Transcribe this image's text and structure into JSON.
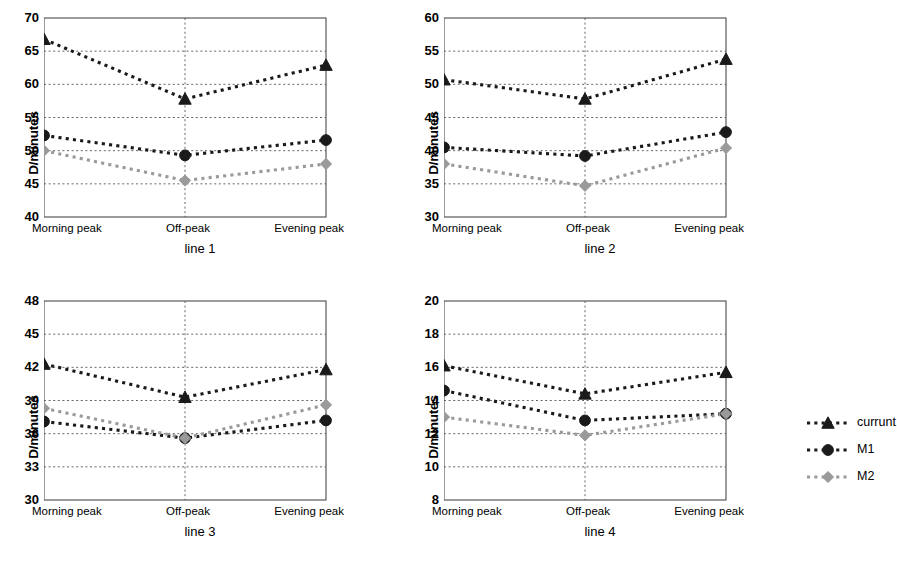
{
  "figure": {
    "background": "#ffffff",
    "series_colors": {
      "currunt": "#1a1a1a",
      "M1": "#1a1a1a",
      "M2": "#9a9a9a"
    },
    "y_axis_label": "D/minutes",
    "categories": [
      "Morning peak",
      "Off-peak",
      "Evening peak"
    ]
  },
  "legend": {
    "position": "right",
    "entries": [
      {
        "label": "currunt",
        "marker": "triangle",
        "color": "#1a1a1a"
      },
      {
        "label": "M1",
        "marker": "circle",
        "color": "#1a1a1a"
      },
      {
        "label": "M2",
        "marker": "diamond",
        "color": "#9a9a9a"
      }
    ]
  },
  "chart_data": [
    {
      "type": "line",
      "title": "line 1",
      "xlabel": "",
      "ylabel": "D/minutes",
      "categories": [
        "Morning peak",
        "Off-peak",
        "Evening peak"
      ],
      "ylim": [
        40,
        70
      ],
      "yticks": [
        40,
        45,
        50,
        55,
        60,
        65,
        70
      ],
      "grid": true,
      "series": [
        {
          "name": "currunt",
          "marker": "triangle",
          "color": "#1a1a1a",
          "values": [
            66.8,
            57.8,
            62.9
          ]
        },
        {
          "name": "M1",
          "marker": "circle",
          "color": "#1a1a1a",
          "values": [
            52.3,
            49.3,
            51.6
          ]
        },
        {
          "name": "M2",
          "marker": "diamond",
          "color": "#9a9a9a",
          "values": [
            50.0,
            45.5,
            48.0
          ]
        }
      ]
    },
    {
      "type": "line",
      "title": "line 2",
      "xlabel": "",
      "ylabel": "D/minutes",
      "categories": [
        "Morning peak",
        "Off-peak",
        "Evening peak"
      ],
      "ylim": [
        30,
        60
      ],
      "yticks": [
        30,
        35,
        40,
        45,
        50,
        55,
        60
      ],
      "grid": true,
      "series": [
        {
          "name": "currunt",
          "marker": "triangle",
          "color": "#1a1a1a",
          "values": [
            50.7,
            47.8,
            53.8
          ]
        },
        {
          "name": "M1",
          "marker": "circle",
          "color": "#1a1a1a",
          "values": [
            40.5,
            39.2,
            42.8
          ]
        },
        {
          "name": "M2",
          "marker": "diamond",
          "color": "#9a9a9a",
          "values": [
            38.0,
            34.7,
            40.4
          ]
        }
      ]
    },
    {
      "type": "line",
      "title": "line 3",
      "xlabel": "",
      "ylabel": "D/minutes",
      "categories": [
        "Morning peak",
        "Off-peak",
        "Evening peak"
      ],
      "ylim": [
        30,
        48
      ],
      "yticks": [
        30,
        33,
        36,
        39,
        42,
        45,
        48
      ],
      "grid": true,
      "series": [
        {
          "name": "currunt",
          "marker": "triangle",
          "color": "#1a1a1a",
          "values": [
            42.3,
            39.3,
            41.8
          ]
        },
        {
          "name": "M1",
          "marker": "circle",
          "color": "#1a1a1a",
          "values": [
            37.1,
            35.6,
            37.2
          ]
        },
        {
          "name": "M2",
          "marker": "diamond",
          "color": "#9a9a9a",
          "values": [
            38.3,
            35.6,
            38.6
          ]
        }
      ]
    },
    {
      "type": "line",
      "title": "line 4",
      "xlabel": "",
      "ylabel": "D/minutes",
      "categories": [
        "Morning peak",
        "Off-peak",
        "Evening peak"
      ],
      "ylim": [
        8,
        20
      ],
      "yticks": [
        8,
        10,
        12,
        14,
        16,
        18,
        20
      ],
      "grid": true,
      "series": [
        {
          "name": "currunt",
          "marker": "triangle",
          "color": "#1a1a1a",
          "values": [
            16.1,
            14.4,
            15.7
          ]
        },
        {
          "name": "M1",
          "marker": "circle",
          "color": "#1a1a1a",
          "values": [
            14.6,
            12.8,
            13.2
          ]
        },
        {
          "name": "M2",
          "marker": "diamond",
          "color": "#9a9a9a",
          "values": [
            13.0,
            11.9,
            13.2
          ]
        }
      ]
    }
  ]
}
